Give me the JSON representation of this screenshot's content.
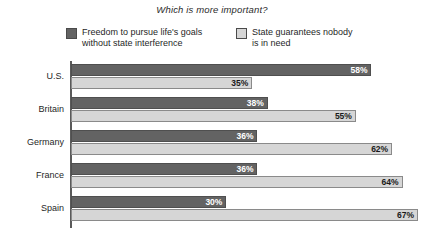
{
  "chart_data": {
    "type": "bar",
    "orientation": "horizontal",
    "title": "Which is more important?",
    "xlabel": "",
    "ylabel": "",
    "xlim": [
      0,
      70
    ],
    "grid": false,
    "legend_position": "top",
    "categories": [
      "U.S.",
      "Britain",
      "Germany",
      "France",
      "Spain"
    ],
    "series": [
      {
        "name": "Freedom to pursue life's goals\nwithout state interference",
        "color": "#636363",
        "values": [
          58,
          38,
          36,
          36,
          30
        ],
        "labels": [
          "58%",
          "35%",
          "36%",
          "36%",
          "30%"
        ]
      },
      {
        "name": "State guarantees nobody\nis in need",
        "color": "#d6d6d6",
        "values": [
          35,
          55,
          62,
          64,
          67
        ],
        "labels": [
          "35%",
          "55%",
          "62%",
          "64%",
          "67%"
        ]
      }
    ],
    "value_suffix": "%"
  },
  "legend": {
    "items": [
      {
        "label": "Freedom to pursue life's goals\nwithout state interference",
        "swatch": "dark-swatch"
      },
      {
        "label": "State guarantees nobody\nis in need",
        "swatch": "light-swatch"
      }
    ]
  },
  "rows": [
    {
      "category": "U.S.",
      "freedom": "58%",
      "state": "35%"
    },
    {
      "category": "Britain",
      "freedom": "38%",
      "state": "55%"
    },
    {
      "category": "Germany",
      "freedom": "36%",
      "state": "62%"
    },
    {
      "category": "France",
      "freedom": "36%",
      "state": "64%"
    },
    {
      "category": "Spain",
      "freedom": "30%",
      "state": "67%"
    }
  ],
  "colors": {
    "dark_bar": "#636363",
    "light_bar": "#d6d6d6",
    "axis": "#5a5a5a",
    "background": "#ffffff"
  }
}
